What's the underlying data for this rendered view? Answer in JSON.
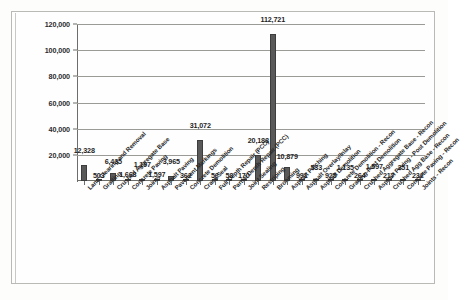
{
  "chart_data": {
    "type": "bar",
    "title": "",
    "subtitle": "",
    "xlabel": "",
    "ylabel": "",
    "ylim": [
      0,
      120000
    ],
    "ytick_values": [
      20000,
      40000,
      60000,
      80000,
      100000,
      120000
    ],
    "ytick_labels": [
      "20,000",
      "40,000",
      "60,000",
      "80,000",
      "100,000",
      "120,000"
    ],
    "grid": "horizontal",
    "legend": "none",
    "bar_color": "#595959",
    "categories": [
      "Land Clearing and Removal",
      "Grading",
      "Crushed Aggregate Base",
      "Concrete Paving",
      "Joints",
      "Asphalt Paving",
      "Pavement Markings",
      "Concrete Demolition",
      "Crack Seal",
      "Full Depth Repair (PCC)",
      "Partial Depth Repair (PCC)",
      "Joint Sealing",
      "Restriping",
      "Brooming",
      "Asphalt Patching",
      "Asphalt Overlay/Inlay",
      "Asphalt Demolition",
      "Concrete Demolition - Recon",
      "Grading-Post Demolition",
      "Crushed Aggregate Base - Recon",
      "Asphalt Paving - Post Demolition",
      "Crushed Agg Base - Recon",
      "Concrete Paving - Recon",
      "Joints - Recon"
    ],
    "values": [
      12328,
      503,
      6435,
      1668,
      1197,
      1597,
      3965,
      362,
      31072,
      56,
      58,
      170,
      20188,
      112721,
      10879,
      991,
      533,
      925,
      1135,
      264,
      1597,
      217,
      251,
      232
    ],
    "value_labels": [
      "12,328",
      "503",
      "6,435",
      "1,668",
      "1,197",
      "1,597",
      "3,965",
      "362",
      "31,072",
      "56",
      "58",
      "170",
      "20,188",
      "112,721",
      "10,879",
      "991",
      "533",
      "925",
      "1,135",
      "264",
      "1,597",
      "217",
      "251",
      "232"
    ]
  }
}
